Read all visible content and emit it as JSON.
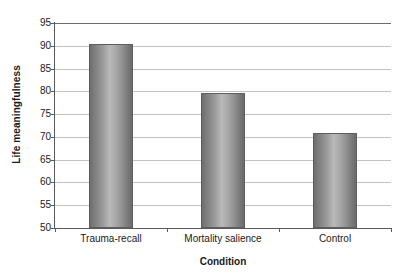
{
  "chart_data": {
    "type": "bar",
    "title": "",
    "subtitle": "",
    "xlabel": "Condition",
    "ylabel": "Life meaningfulness",
    "categories": [
      "Trauma-recall",
      "Mortality salience",
      "Control"
    ],
    "values": [
      90.5,
      79.7,
      70.9
    ],
    "ylim": [
      50,
      95
    ],
    "yticks": [
      50,
      55,
      60,
      65,
      70,
      75,
      80,
      85,
      90,
      95
    ],
    "ytick_labels": [
      "50",
      "55",
      "60",
      "65",
      "70",
      "75",
      "80",
      "85",
      "90",
      "95"
    ],
    "grid": true,
    "grid_axis": "y",
    "legend": false,
    "legend_position": "none",
    "bar_color": "#9a9a9a",
    "bar_edge_color": "#5e5e5e",
    "grid_color": "#c2c2c2",
    "axis_color": "#5a5a5a",
    "background_color": "#ffffff",
    "text_color": "#1a1a1a"
  }
}
